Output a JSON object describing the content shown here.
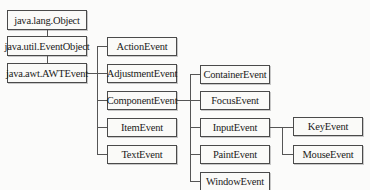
{
  "diagram": {
    "type": "class-hierarchy",
    "root_chain": [
      {
        "id": "object",
        "label": "java.lang.Object"
      },
      {
        "id": "eventobject",
        "label": "java.util.EventObject"
      },
      {
        "id": "awtevent",
        "label": "java.awt.AWTEvent"
      }
    ],
    "awtevent_children": [
      {
        "id": "action",
        "label": "ActionEvent"
      },
      {
        "id": "adjustment",
        "label": "AdjustmentEvent"
      },
      {
        "id": "component",
        "label": "ComponentEvent"
      },
      {
        "id": "item",
        "label": "ItemEvent"
      },
      {
        "id": "text",
        "label": "TextEvent"
      }
    ],
    "componentevent_children": [
      {
        "id": "container",
        "label": "ContainerEvent"
      },
      {
        "id": "focus",
        "label": "FocusEvent"
      },
      {
        "id": "input",
        "label": "InputEvent"
      },
      {
        "id": "paint",
        "label": "PaintEvent"
      },
      {
        "id": "window",
        "label": "WindowEvent"
      }
    ],
    "inputevent_children": [
      {
        "id": "key",
        "label": "KeyEvent"
      },
      {
        "id": "mouse",
        "label": "MouseEvent"
      }
    ],
    "edges": [
      [
        "java.lang.Object",
        "java.util.EventObject"
      ],
      [
        "java.util.EventObject",
        "java.awt.AWTEvent"
      ],
      [
        "java.awt.AWTEvent",
        "ActionEvent"
      ],
      [
        "java.awt.AWTEvent",
        "AdjustmentEvent"
      ],
      [
        "java.awt.AWTEvent",
        "ComponentEvent"
      ],
      [
        "java.awt.AWTEvent",
        "ItemEvent"
      ],
      [
        "java.awt.AWTEvent",
        "TextEvent"
      ],
      [
        "ComponentEvent",
        "ContainerEvent"
      ],
      [
        "ComponentEvent",
        "FocusEvent"
      ],
      [
        "ComponentEvent",
        "InputEvent"
      ],
      [
        "ComponentEvent",
        "PaintEvent"
      ],
      [
        "ComponentEvent",
        "WindowEvent"
      ],
      [
        "InputEvent",
        "KeyEvent"
      ],
      [
        "InputEvent",
        "MouseEvent"
      ]
    ]
  }
}
